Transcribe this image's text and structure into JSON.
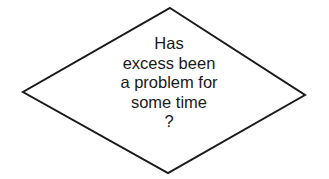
{
  "diagram": {
    "type": "flowchart-decision",
    "shape": "diamond",
    "stroke_color": "#1a1a1a",
    "fill_color": "#ffffff",
    "decision_node": {
      "lines": [
        "Has",
        "excess been",
        "a problem for",
        "some time",
        "?"
      ],
      "full_text": "Has excess been a problem for some time ?"
    }
  }
}
